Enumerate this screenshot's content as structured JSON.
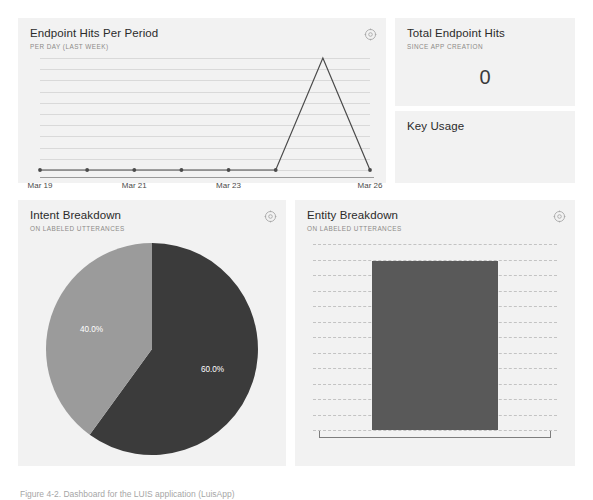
{
  "page": {
    "background": "#ffffff",
    "panel_background": "#f2f2f2",
    "caption": "Figure 4-2. Dashboard for the LUIS application (LuisApp)"
  },
  "panels": {
    "endpoint_hits": {
      "title": "Endpoint Hits Per Period",
      "subtitle": "PER DAY (LAST WEEK)",
      "gear_icon": "gear-icon"
    },
    "total_hits": {
      "title": "Total Endpoint Hits",
      "subtitle": "SINCE APP CREATION",
      "value": "0"
    },
    "key_usage": {
      "title": "Key Usage",
      "subtitle": ""
    },
    "intent_breakdown": {
      "title": "Intent Breakdown",
      "subtitle": "ON LABELED UTTERANCES",
      "gear_icon": "gear-icon"
    },
    "entity_breakdown": {
      "title": "Entity Breakdown",
      "subtitle": "ON LABELED UTTERANCES",
      "gear_icon": "gear-icon"
    }
  },
  "chart_data": [
    {
      "id": "endpoint-hits-line",
      "type": "line",
      "title": "Endpoint Hits Per Period",
      "subtitle": "PER DAY (LAST WEEK)",
      "xlabel": "",
      "ylabel": "",
      "x": [
        "Mar 19",
        "Mar 20",
        "Mar 21",
        "Mar 22",
        "Mar 23",
        "Mar 24",
        "Mar 25",
        "Mar 26"
      ],
      "tick_labels": [
        "Mar 19",
        "Mar 21",
        "Mar 23",
        "Mar 26"
      ],
      "tick_indices": [
        0,
        2,
        4,
        7
      ],
      "values": [
        0,
        0,
        0,
        0,
        0,
        0,
        10,
        0
      ],
      "ylim": [
        0,
        10
      ],
      "grid": true,
      "gridline_count": 10,
      "line_color": "#4a4a4a",
      "marker_color": "#4a4a4a"
    },
    {
      "id": "intent-breakdown-pie",
      "type": "pie",
      "title": "Intent Breakdown",
      "subtitle": "ON LABELED UTTERANCES",
      "labels": [
        "60.0%",
        "40.0%"
      ],
      "values": [
        60.0,
        40.0
      ],
      "colors": [
        "#3b3b3b",
        "#9b9b9b"
      ],
      "legend": "none",
      "start_angle_deg": 0
    },
    {
      "id": "entity-breakdown-bar",
      "type": "bar",
      "title": "Entity Breakdown",
      "subtitle": "ON LABELED UTTERANCES",
      "categories": [
        ""
      ],
      "values": [
        100
      ],
      "ylim": [
        0,
        110
      ],
      "grid": true,
      "gridline_count": 12,
      "bar_color": "#595959",
      "xlabel": "",
      "ylabel": ""
    }
  ]
}
